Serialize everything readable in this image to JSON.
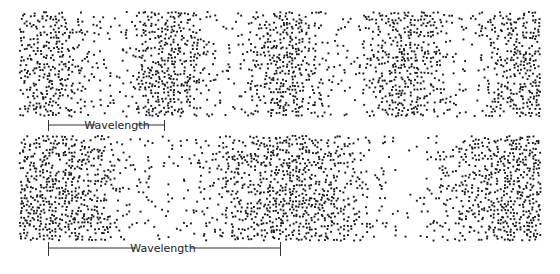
{
  "diagram": {
    "type": "wave-compression-density",
    "width": 560,
    "height": 274,
    "dot_color": "#1a1a1a",
    "panels": [
      {
        "id": "short-wavelength",
        "x0": 20,
        "x1": 540,
        "y0": 12,
        "y1": 117,
        "dense_band_centers": [
          45,
          165,
          285,
          405,
          525
        ],
        "period_px": 120,
        "bracket": {
          "x_start": 48,
          "x_end": 164,
          "y": 125,
          "label": "Wavelength"
        }
      },
      {
        "id": "long-wavelength",
        "x0": 20,
        "x1": 540,
        "y0": 136,
        "y1": 240,
        "dense_band_centers": [
          45,
          285,
          525
        ],
        "period_px": 240,
        "bracket": {
          "x_start": 48,
          "x_end": 280,
          "y": 248,
          "label": "Wavelength"
        }
      }
    ]
  },
  "labels": {
    "top_bracket": "Wavelength",
    "bottom_bracket": "Wavelength"
  }
}
